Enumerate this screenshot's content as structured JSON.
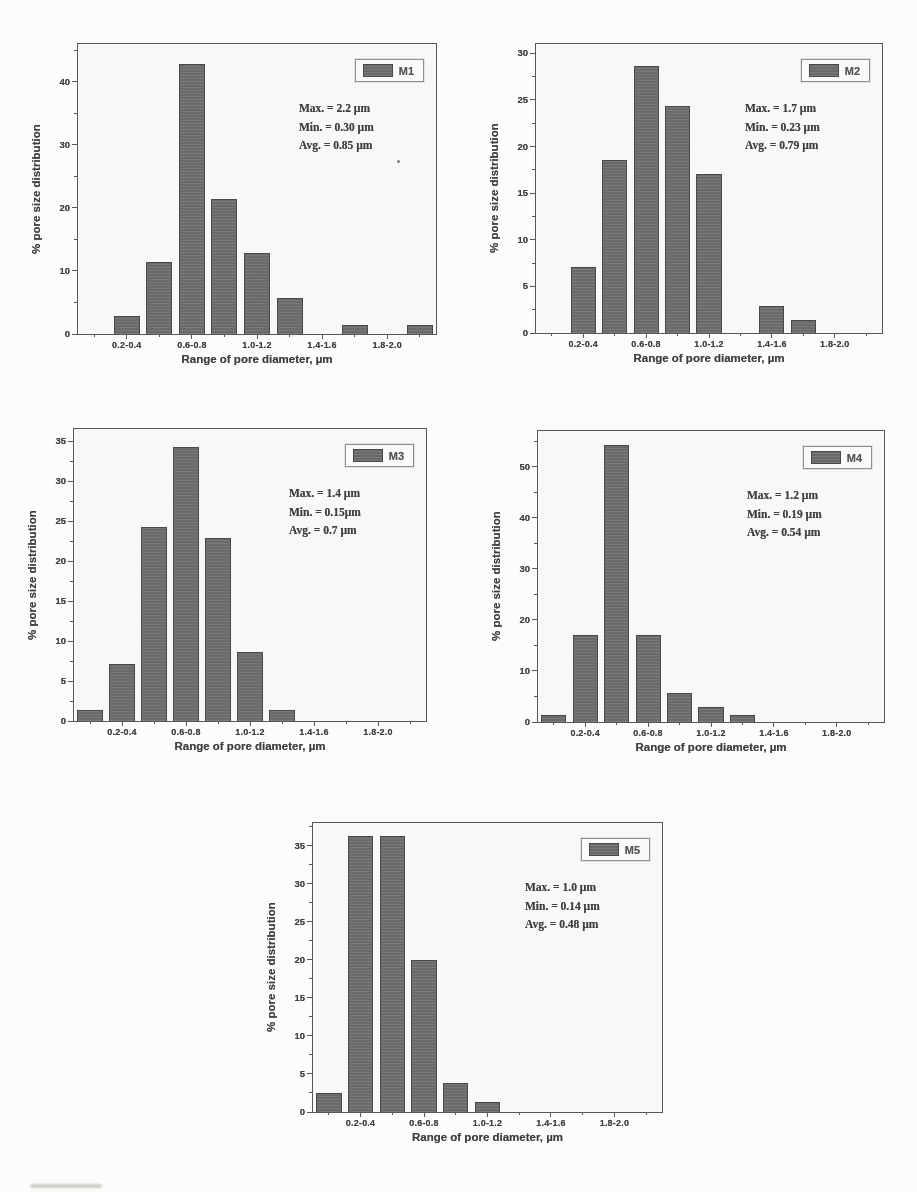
{
  "colors": {
    "paper": "#fcfcfa",
    "bar": "#6f6f6f",
    "bar_border": "#474747",
    "frame": "#565656",
    "text": "#3d3d3d"
  },
  "chart_data": [
    {
      "id": "M1",
      "type": "bar",
      "legend": "M1",
      "stats": {
        "max": "Max. = 2.2 µm",
        "min": "Min. = 0.30 µm",
        "avg": "Avg. = 0.85 µm"
      },
      "ylabel": "% pore size distribution",
      "xlabel": "Range of pore diameter, µm",
      "categories": [
        "0.0-0.2",
        "0.2-0.4",
        "0.4-0.6",
        "0.6-0.8",
        "0.8-1.0",
        "1.0-1.2",
        "1.2-1.4",
        "1.4-1.6",
        "1.6-1.8",
        "1.8-2.0",
        "2.0-2.2"
      ],
      "values": [
        0,
        2.9,
        11.4,
        42.9,
        21.4,
        12.9,
        5.7,
        0,
        1.4,
        0,
        1.4
      ],
      "x_tick_labels": [
        "0.2-0.4",
        "0.6-0.8",
        "1.0-1.2",
        "1.4-1.6",
        "1.8-2.0"
      ],
      "labeled_slots": [
        1,
        3,
        5,
        7,
        9
      ],
      "ylim": [
        0,
        46
      ],
      "yticks": [
        0,
        10,
        20,
        30,
        40
      ],
      "grid": "off",
      "legend_position": "top-right"
    },
    {
      "id": "M2",
      "type": "bar",
      "legend": "M2",
      "stats": {
        "max": "Max. = 1.7 µm",
        "min": "Min. = 0.23 µm",
        "avg": "Avg. = 0.79 µm"
      },
      "ylabel": "% pore size distribution",
      "xlabel": "Range of pore diameter, µm",
      "categories": [
        "0.0-0.2",
        "0.2-0.4",
        "0.4-0.6",
        "0.6-0.8",
        "0.8-1.0",
        "1.0-1.2",
        "1.2-1.4",
        "1.4-1.6",
        "1.6-1.8",
        "1.8-2.0",
        "2.0-2.2"
      ],
      "values": [
        0,
        7.1,
        18.6,
        28.6,
        24.3,
        17.1,
        0,
        2.9,
        1.4,
        0,
        0
      ],
      "x_tick_labels": [
        "0.2-0.4",
        "0.6-0.8",
        "1.0-1.2",
        "1.4-1.6",
        "1.8-2.0"
      ],
      "labeled_slots": [
        1,
        3,
        5,
        7,
        9
      ],
      "ylim": [
        0,
        31
      ],
      "yticks": [
        0,
        5,
        10,
        15,
        20,
        25,
        30
      ],
      "grid": "off",
      "legend_position": "top-right"
    },
    {
      "id": "M3",
      "type": "bar",
      "legend": "M3",
      "stats": {
        "max": "Max. = 1.4 µm",
        "min": "Min. = 0.15µm",
        "avg": "Avg. = 0.7 µm"
      },
      "ylabel": "% pore size distribution",
      "xlabel": "Range of pore diameter, µm",
      "categories": [
        "0.0-0.2",
        "0.2-0.4",
        "0.4-0.6",
        "0.6-0.8",
        "0.8-1.0",
        "1.0-1.2",
        "1.2-1.4",
        "1.4-1.6",
        "1.6-1.8",
        "1.8-2.0",
        "2.0-2.2"
      ],
      "values": [
        1.4,
        7.1,
        24.3,
        34.3,
        22.9,
        8.6,
        1.4,
        0,
        0,
        0,
        0
      ],
      "x_tick_labels": [
        "0.2-0.4",
        "0.6-0.8",
        "1.0-1.2",
        "1.4-1.6",
        "1.8-2.0"
      ],
      "labeled_slots": [
        1,
        3,
        5,
        7,
        9
      ],
      "ylim": [
        0,
        36.5
      ],
      "yticks": [
        0,
        5,
        10,
        15,
        20,
        25,
        30,
        35
      ],
      "grid": "off",
      "legend_position": "top-right"
    },
    {
      "id": "M4",
      "type": "bar",
      "legend": "M4",
      "stats": {
        "max": "Max. = 1.2 µm",
        "min": "Min. = 0.19 µm",
        "avg": "Avg. = 0.54 µm"
      },
      "ylabel": "% pore size distribution",
      "xlabel": "Range of pore diameter, µm",
      "categories": [
        "0.0-0.2",
        "0.2-0.4",
        "0.4-0.6",
        "0.6-0.8",
        "0.8-1.0",
        "1.0-1.2",
        "1.2-1.4",
        "1.4-1.6",
        "1.6-1.8",
        "1.8-2.0",
        "2.0-2.2"
      ],
      "values": [
        1.4,
        17.1,
        54.3,
        17.1,
        5.7,
        2.9,
        1.4,
        0,
        0,
        0,
        0
      ],
      "x_tick_labels": [
        "0.2-0.4",
        "0.6-0.8",
        "1.0-1.2",
        "1.4-1.6",
        "1.8-2.0"
      ],
      "labeled_slots": [
        1,
        3,
        5,
        7,
        9
      ],
      "ylim": [
        0,
        57
      ],
      "yticks": [
        0,
        10,
        20,
        30,
        40,
        50
      ],
      "grid": "off",
      "legend_position": "top-right"
    },
    {
      "id": "M5",
      "type": "bar",
      "legend": "M5",
      "stats": {
        "max": "Max. = 1.0 µm",
        "min": "Min. = 0.14 µm",
        "avg": "Avg. = 0.48 µm"
      },
      "ylabel": "% pore size distribution",
      "xlabel": "Range of pore diameter, µm",
      "categories": [
        "0.0-0.2",
        "0.2-0.4",
        "0.4-0.6",
        "0.6-0.8",
        "0.8-1.0",
        "1.0-1.2",
        "1.2-1.4",
        "1.4-1.6",
        "1.6-1.8",
        "1.8-2.0",
        "2.0-2.2"
      ],
      "values": [
        2.5,
        36.3,
        36.3,
        20.0,
        3.8,
        1.3,
        0,
        0,
        0,
        0,
        0
      ],
      "x_tick_labels": [
        "0.2-0.4",
        "0.6-0.8",
        "1.0-1.2",
        "1.4-1.6",
        "1.8-2.0"
      ],
      "labeled_slots": [
        1,
        3,
        5,
        7,
        9
      ],
      "ylim": [
        0,
        38
      ],
      "yticks": [
        0,
        5,
        10,
        15,
        20,
        25,
        30,
        35
      ],
      "grid": "off",
      "legend_position": "top-right"
    }
  ]
}
